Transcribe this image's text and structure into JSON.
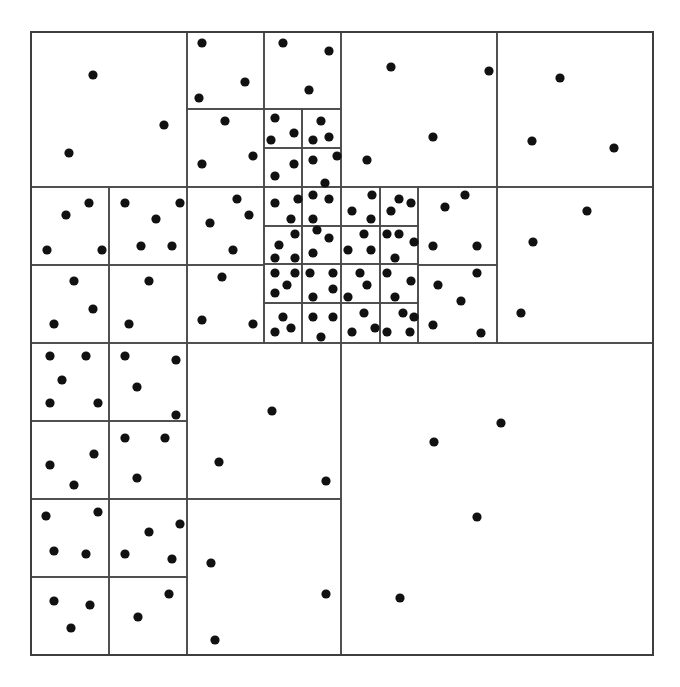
{
  "diagram": {
    "type": "quadtree",
    "outer_box": [
      31,
      32,
      653,
      655
    ],
    "colors": {
      "line": "#4a4a4a",
      "outer_line": "#3e3e3e",
      "point": "#111111",
      "background": "#ffffff"
    },
    "point_radius": 4.6,
    "cells": [
      [
        31,
        32,
        187,
        187
      ],
      [
        187,
        32,
        264,
        109
      ],
      [
        264,
        32,
        341,
        109
      ],
      [
        187,
        109,
        264,
        187
      ],
      [
        264,
        109,
        302,
        148
      ],
      [
        302,
        109,
        341,
        148
      ],
      [
        264,
        148,
        302,
        187
      ],
      [
        302,
        148,
        341,
        187
      ],
      [
        31,
        187,
        109,
        265
      ],
      [
        109,
        187,
        187,
        265
      ],
      [
        31,
        265,
        109,
        343
      ],
      [
        109,
        265,
        187,
        343
      ],
      [
        187,
        187,
        264,
        265
      ],
      [
        187,
        265,
        264,
        343
      ],
      [
        264,
        187,
        302,
        226
      ],
      [
        302,
        187,
        341,
        226
      ],
      [
        341,
        187,
        380,
        226
      ],
      [
        380,
        187,
        418,
        226
      ],
      [
        264,
        226,
        302,
        264
      ],
      [
        302,
        226,
        341,
        264
      ],
      [
        341,
        226,
        380,
        264
      ],
      [
        380,
        226,
        418,
        264
      ],
      [
        264,
        264,
        302,
        303
      ],
      [
        302,
        264,
        341,
        303
      ],
      [
        341,
        264,
        380,
        303
      ],
      [
        380,
        264,
        418,
        303
      ],
      [
        264,
        303,
        302,
        343
      ],
      [
        302,
        303,
        341,
        343
      ],
      [
        341,
        303,
        380,
        343
      ],
      [
        380,
        303,
        418,
        343
      ],
      [
        341,
        32,
        497,
        187
      ],
      [
        497,
        32,
        653,
        187
      ],
      [
        418,
        187,
        497,
        265
      ],
      [
        418,
        265,
        497,
        343
      ],
      [
        497,
        187,
        653,
        343
      ],
      [
        31,
        343,
        109,
        421
      ],
      [
        109,
        343,
        187,
        421
      ],
      [
        31,
        421,
        109,
        499
      ],
      [
        109,
        421,
        187,
        499
      ],
      [
        31,
        499,
        109,
        577
      ],
      [
        109,
        499,
        187,
        577
      ],
      [
        31,
        577,
        109,
        655
      ],
      [
        109,
        577,
        187,
        655
      ],
      [
        187,
        343,
        341,
        499
      ],
      [
        187,
        499,
        341,
        655
      ],
      [
        341,
        343,
        653,
        655
      ]
    ],
    "points": [
      [
        93,
        75
      ],
      [
        164,
        125
      ],
      [
        69,
        153
      ],
      [
        202,
        43
      ],
      [
        245,
        82
      ],
      [
        199,
        98
      ],
      [
        283,
        43
      ],
      [
        329,
        51
      ],
      [
        309,
        90
      ],
      [
        225,
        121
      ],
      [
        253,
        156
      ],
      [
        202,
        164
      ],
      [
        275,
        118
      ],
      [
        294,
        133
      ],
      [
        271,
        140
      ],
      [
        321,
        121
      ],
      [
        329,
        137
      ],
      [
        313,
        140
      ],
      [
        294,
        164
      ],
      [
        275,
        176
      ],
      [
        313,
        160
      ],
      [
        337,
        156
      ],
      [
        325,
        183
      ],
      [
        89,
        203
      ],
      [
        66,
        215
      ],
      [
        47,
        250
      ],
      [
        102,
        250
      ],
      [
        125,
        203
      ],
      [
        180,
        203
      ],
      [
        156,
        219
      ],
      [
        141,
        246
      ],
      [
        172,
        246
      ],
      [
        74,
        281
      ],
      [
        93,
        309
      ],
      [
        54,
        324
      ],
      [
        149,
        281
      ],
      [
        129,
        324
      ],
      [
        237,
        199
      ],
      [
        249,
        215
      ],
      [
        210,
        223
      ],
      [
        233,
        250
      ],
      [
        222,
        277
      ],
      [
        202,
        320
      ],
      [
        253,
        324
      ],
      [
        275,
        203
      ],
      [
        298,
        199
      ],
      [
        291,
        219
      ],
      [
        313,
        195
      ],
      [
        329,
        199
      ],
      [
        313,
        219
      ],
      [
        372,
        195
      ],
      [
        352,
        211
      ],
      [
        371,
        219
      ],
      [
        399,
        199
      ],
      [
        411,
        203
      ],
      [
        391,
        211
      ],
      [
        295,
        234
      ],
      [
        279,
        245
      ],
      [
        275,
        258
      ],
      [
        295,
        258
      ],
      [
        317,
        230
      ],
      [
        329,
        238
      ],
      [
        313,
        253
      ],
      [
        364,
        234
      ],
      [
        348,
        250
      ],
      [
        371,
        250
      ],
      [
        387,
        234
      ],
      [
        399,
        234
      ],
      [
        414,
        242
      ],
      [
        395,
        258
      ],
      [
        275,
        273
      ],
      [
        295,
        273
      ],
      [
        287,
        285
      ],
      [
        275,
        293
      ],
      [
        310,
        273
      ],
      [
        333,
        273
      ],
      [
        333,
        289
      ],
      [
        313,
        297
      ],
      [
        360,
        273
      ],
      [
        367,
        285
      ],
      [
        348,
        297
      ],
      [
        387,
        273
      ],
      [
        411,
        281
      ],
      [
        395,
        297
      ],
      [
        283,
        317
      ],
      [
        291,
        328
      ],
      [
        275,
        332
      ],
      [
        313,
        317
      ],
      [
        333,
        317
      ],
      [
        321,
        337
      ],
      [
        364,
        313
      ],
      [
        375,
        328
      ],
      [
        352,
        332
      ],
      [
        403,
        313
      ],
      [
        414,
        317
      ],
      [
        387,
        332
      ],
      [
        410,
        332
      ],
      [
        391,
        67
      ],
      [
        489,
        71
      ],
      [
        433,
        137
      ],
      [
        367,
        160
      ],
      [
        560,
        78
      ],
      [
        532,
        141
      ],
      [
        614,
        148
      ],
      [
        465,
        195
      ],
      [
        445,
        207
      ],
      [
        433,
        246
      ],
      [
        477,
        246
      ],
      [
        477,
        273
      ],
      [
        438,
        285
      ],
      [
        461,
        301
      ],
      [
        433,
        325
      ],
      [
        481,
        333
      ],
      [
        587,
        211
      ],
      [
        533,
        242
      ],
      [
        521,
        313
      ],
      [
        50,
        356
      ],
      [
        86,
        356
      ],
      [
        62,
        380
      ],
      [
        50,
        403
      ],
      [
        98,
        403
      ],
      [
        125,
        356
      ],
      [
        176,
        360
      ],
      [
        137,
        387
      ],
      [
        176,
        415
      ],
      [
        94,
        454
      ],
      [
        50,
        465
      ],
      [
        74,
        485
      ],
      [
        125,
        438
      ],
      [
        165,
        438
      ],
      [
        137,
        478
      ],
      [
        46,
        516
      ],
      [
        98,
        512
      ],
      [
        54,
        551
      ],
      [
        86,
        554
      ],
      [
        180,
        524
      ],
      [
        149,
        532
      ],
      [
        125,
        554
      ],
      [
        172,
        559
      ],
      [
        54,
        601
      ],
      [
        90,
        605
      ],
      [
        71,
        628
      ],
      [
        169,
        594
      ],
      [
        138,
        617
      ],
      [
        272,
        411
      ],
      [
        219,
        462
      ],
      [
        326,
        481
      ],
      [
        211,
        563
      ],
      [
        326,
        594
      ],
      [
        215,
        640
      ],
      [
        501,
        423
      ],
      [
        434,
        442
      ],
      [
        477,
        517
      ],
      [
        400,
        598
      ]
    ]
  }
}
